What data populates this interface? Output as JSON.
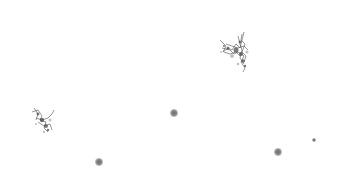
{
  "image": {
    "background": "#ffffff",
    "description": "Grayscale specks on white background",
    "objects": [
      {
        "type": "cluster",
        "x": 234,
        "y": 50,
        "w": 40,
        "h": 50
      },
      {
        "type": "cluster",
        "x": 43,
        "y": 118,
        "w": 30,
        "h": 36
      },
      {
        "type": "dot",
        "x": 174,
        "y": 113,
        "r": 3
      },
      {
        "type": "dot",
        "x": 99,
        "y": 162,
        "r": 3
      },
      {
        "type": "dot",
        "x": 278,
        "y": 152,
        "r": 3
      },
      {
        "type": "dot",
        "x": 314,
        "y": 140,
        "r": 1.5
      }
    ]
  }
}
